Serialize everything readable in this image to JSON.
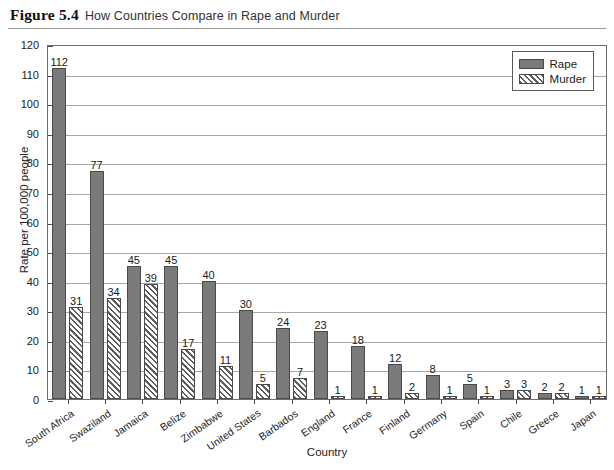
{
  "figure": {
    "label": "Figure 5.4",
    "title": "How Countries Compare in Rape and Murder"
  },
  "chart_data": {
    "type": "bar",
    "title": "How Countries Compare in Rape and Murder",
    "xlabel": "Country",
    "ylabel": "Rate per 100,000 people",
    "ylim": [
      0,
      120
    ],
    "ytick_step": 10,
    "yticks": [
      0,
      10,
      20,
      30,
      40,
      50,
      60,
      70,
      80,
      90,
      100,
      110,
      120
    ],
    "grid": true,
    "legend_position": "top-right",
    "categories": [
      "South Africa",
      "Swaziland",
      "Jamaica",
      "Belize",
      "Zimbabwe",
      "United States",
      "Barbados",
      "England",
      "France",
      "Finland",
      "Germany",
      "Spain",
      "Chile",
      "Greece",
      "Japan"
    ],
    "series": [
      {
        "name": "Rape",
        "color": "#7a7a7a",
        "fill": "solid",
        "values": [
          112,
          77,
          45,
          45,
          40,
          30,
          24,
          23,
          18,
          12,
          8,
          5,
          3,
          2,
          1
        ]
      },
      {
        "name": "Murder",
        "color": "#5e5e5e",
        "fill": "diagonal-hatch",
        "values": [
          31,
          34,
          39,
          17,
          11,
          5,
          7,
          1,
          1,
          2,
          1,
          1,
          3,
          2,
          1
        ]
      }
    ]
  }
}
